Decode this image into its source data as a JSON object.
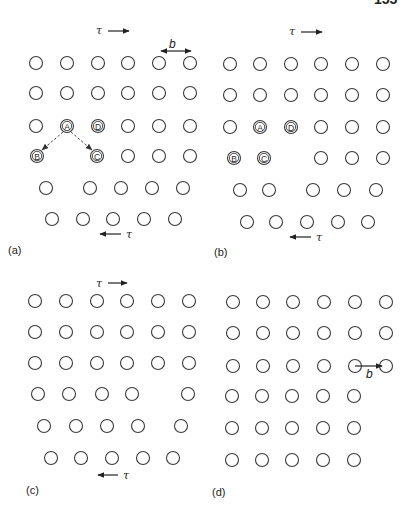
{
  "page": {
    "page_number_partial": "155",
    "bg_color": "#ffffff",
    "ink_color": "#222222"
  },
  "symbols": {
    "tau": "τ",
    "b": "b"
  },
  "atom_radius": 6.5,
  "panels": [
    {
      "id": "a",
      "label": "(a)",
      "label_pos": [
        8,
        254
      ],
      "tau_top": {
        "text_pos": [
          96,
          34
        ],
        "arrow": [
          108,
          31,
          129,
          31
        ],
        "dir": "right"
      },
      "tau_bottom": {
        "text_pos": [
          126,
          238
        ],
        "arrow": [
          121,
          234,
          100,
          234
        ],
        "dir": "left"
      },
      "burgers": {
        "label_pos": [
          169,
          48
        ],
        "arrow": [
          161,
          51,
          191,
          51
        ],
        "double": true
      },
      "atoms": [
        [
          36,
          63
        ],
        [
          67,
          63
        ],
        [
          98,
          63
        ],
        [
          128,
          63
        ],
        [
          159,
          63
        ],
        [
          190,
          63
        ],
        [
          36,
          93
        ],
        [
          67,
          93
        ],
        [
          98,
          93
        ],
        [
          128,
          93
        ],
        [
          159,
          93
        ],
        [
          190,
          93
        ],
        [
          36,
          126
        ],
        [
          128,
          126
        ],
        [
          159,
          126
        ],
        [
          190,
          126
        ],
        [
          128,
          156
        ],
        [
          159,
          156
        ],
        [
          190,
          156
        ],
        [
          46,
          188
        ],
        [
          90,
          188
        ],
        [
          121,
          188
        ],
        [
          152,
          188
        ],
        [
          183,
          188
        ],
        [
          52,
          219
        ],
        [
          83,
          219
        ],
        [
          113,
          219
        ],
        [
          144,
          219
        ],
        [
          175,
          219
        ]
      ],
      "labeled_atoms": [
        {
          "letter": "A",
          "pos": [
            67,
            126
          ]
        },
        {
          "letter": "D",
          "pos": [
            98,
            126
          ]
        },
        {
          "letter": "B",
          "pos": [
            37,
            156
          ]
        },
        {
          "letter": "C",
          "pos": [
            97,
            156
          ]
        }
      ],
      "dashed_arrows": [
        {
          "from": "A",
          "to": "B",
          "line": [
            63,
            132,
            42,
            150
          ]
        },
        {
          "from": "A",
          "to": "C",
          "line": [
            71,
            132,
            92,
            150
          ]
        }
      ]
    },
    {
      "id": "b",
      "label": "(b)",
      "label_pos": [
        214,
        256
      ],
      "tau_top": {
        "text_pos": [
          289,
          35
        ],
        "arrow": [
          301,
          32,
          322,
          32
        ],
        "dir": "right"
      },
      "tau_bottom": {
        "text_pos": [
          316,
          241
        ],
        "arrow": [
          311,
          237,
          290,
          237
        ],
        "dir": "left"
      },
      "atoms": [
        [
          230,
          64
        ],
        [
          260,
          64
        ],
        [
          291,
          64
        ],
        [
          321,
          64
        ],
        [
          352,
          64
        ],
        [
          383,
          64
        ],
        [
          230,
          95
        ],
        [
          260,
          95
        ],
        [
          291,
          95
        ],
        [
          321,
          95
        ],
        [
          352,
          95
        ],
        [
          383,
          95
        ],
        [
          230,
          127
        ],
        [
          321,
          127
        ],
        [
          352,
          127
        ],
        [
          383,
          127
        ],
        [
          321,
          158
        ],
        [
          352,
          158
        ],
        [
          383,
          158
        ],
        [
          240,
          190
        ],
        [
          269,
          190
        ],
        [
          313,
          190
        ],
        [
          344,
          190
        ],
        [
          376,
          190
        ],
        [
          247,
          222
        ],
        [
          276,
          222
        ],
        [
          307,
          222
        ],
        [
          338,
          222
        ],
        [
          368,
          222
        ]
      ],
      "labeled_atoms": [
        {
          "letter": "A",
          "pos": [
            260,
            127
          ]
        },
        {
          "letter": "D",
          "pos": [
            291,
            127
          ]
        },
        {
          "letter": "B",
          "pos": [
            234,
            158
          ]
        },
        {
          "letter": "C",
          "pos": [
            264,
            158
          ]
        }
      ],
      "dashed_arrows": []
    },
    {
      "id": "c",
      "label": "(c)",
      "label_pos": [
        26,
        494
      ],
      "tau_top": {
        "text_pos": [
          96,
          287
        ],
        "arrow": [
          108,
          283,
          127,
          283
        ],
        "dir": "right"
      },
      "tau_bottom": {
        "text_pos": [
          123,
          479
        ],
        "arrow": [
          118,
          475,
          98,
          475
        ],
        "dir": "left"
      },
      "atoms": [
        [
          35,
          301
        ],
        [
          66,
          301
        ],
        [
          97,
          301
        ],
        [
          127,
          301
        ],
        [
          158,
          301
        ],
        [
          189,
          301
        ],
        [
          35,
          332
        ],
        [
          66,
          332
        ],
        [
          97,
          332
        ],
        [
          127,
          332
        ],
        [
          158,
          332
        ],
        [
          189,
          332
        ],
        [
          35,
          363
        ],
        [
          66,
          363
        ],
        [
          97,
          363
        ],
        [
          127,
          363
        ],
        [
          158,
          363
        ],
        [
          189,
          363
        ],
        [
          38,
          394
        ],
        [
          69,
          394
        ],
        [
          102,
          394
        ],
        [
          132,
          394
        ],
        [
          188,
          394
        ],
        [
          44,
          426
        ],
        [
          76,
          426
        ],
        [
          107,
          426
        ],
        [
          138,
          426
        ],
        [
          181,
          426
        ],
        [
          51,
          458
        ],
        [
          81,
          458
        ],
        [
          112,
          458
        ],
        [
          143,
          458
        ],
        [
          173,
          458
        ]
      ],
      "labeled_atoms": [],
      "dashed_arrows": []
    },
    {
      "id": "d",
      "label": "(d)",
      "label_pos": [
        212,
        496
      ],
      "burgers": {
        "label_pos": [
          366,
          378
        ],
        "arrow": [
          355,
          366,
          382,
          366
        ],
        "double": false
      },
      "atoms": [
        [
          233,
          302
        ],
        [
          263,
          302
        ],
        [
          293,
          302
        ],
        [
          324,
          302
        ],
        [
          355,
          302
        ],
        [
          386,
          302
        ],
        [
          233,
          333
        ],
        [
          263,
          333
        ],
        [
          293,
          333
        ],
        [
          324,
          333
        ],
        [
          355,
          333
        ],
        [
          386,
          333
        ],
        [
          233,
          366
        ],
        [
          263,
          366
        ],
        [
          293,
          366
        ],
        [
          324,
          366
        ],
        [
          355,
          366
        ],
        [
          386,
          366
        ],
        [
          232,
          396
        ],
        [
          262,
          396
        ],
        [
          292,
          396
        ],
        [
          323,
          396
        ],
        [
          354,
          396
        ],
        [
          232,
          428
        ],
        [
          262,
          428
        ],
        [
          292,
          428
        ],
        [
          323,
          428
        ],
        [
          354,
          428
        ],
        [
          232,
          460
        ],
        [
          262,
          460
        ],
        [
          292,
          460
        ],
        [
          323,
          460
        ],
        [
          354,
          460
        ]
      ],
      "labeled_atoms": [],
      "dashed_arrows": []
    }
  ]
}
